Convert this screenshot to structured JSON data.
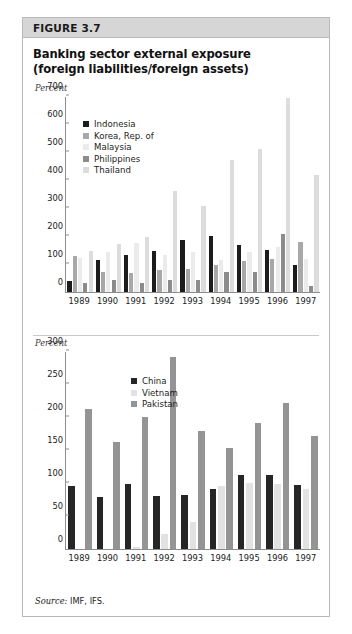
{
  "figure": {
    "label": "FIGURE 3.7",
    "title_line1": "Banking sector external exposure",
    "title_line2": "(foreign liabilities/foreign assets)",
    "source_prefix": "Source:",
    "source_text": "IMF, IFS."
  },
  "colors": {
    "header_band": "#d6d6d6",
    "frame_border": "#b9b9b9",
    "axis": "#8d8d8d",
    "indonesia": "#1c1c1c",
    "korea": "#a8a8a8",
    "malaysia": "#ebebeb",
    "philippines": "#8c8c8c",
    "thailand": "#dcdcdc",
    "china": "#262626",
    "vietnam": "#e2e2e2",
    "pakistan": "#949494"
  },
  "chart_data": [
    {
      "type": "bar",
      "id": "asia-crisis-economies",
      "title": "Banking sector external exposure (foreign liabilities/foreign assets)",
      "xlabel": "",
      "ylabel": "Percent",
      "ylim": [
        0,
        700
      ],
      "yticks": [
        0,
        100,
        200,
        300,
        400,
        500,
        600,
        700
      ],
      "grid": false,
      "legend_position": "upper-left",
      "categories": [
        "1989",
        "1990",
        "1991",
        "1992",
        "1993",
        "1994",
        "1995",
        "1996",
        "1997"
      ],
      "series": [
        {
          "name": "Indonesia",
          "color": "#1c1c1c",
          "values": [
            38,
            112,
            130,
            145,
            185,
            200,
            165,
            148,
            95
          ]
        },
        {
          "name": "Korea, Rep. of",
          "color": "#a8a8a8",
          "values": [
            128,
            72,
            65,
            78,
            82,
            95,
            108,
            118,
            178
          ]
        },
        {
          "name": "Malaysia",
          "color": "#ebebeb",
          "values": [
            120,
            140,
            175,
            130,
            142,
            112,
            140,
            160,
            118
          ]
        },
        {
          "name": "Philippines",
          "color": "#8c8c8c",
          "values": [
            30,
            42,
            30,
            42,
            40,
            70,
            72,
            205,
            22
          ]
        },
        {
          "name": "Thailand",
          "color": "#dcdcdc",
          "values": [
            145,
            170,
            195,
            360,
            305,
            470,
            510,
            690,
            415
          ]
        }
      ]
    },
    {
      "type": "bar",
      "id": "other-asian-economies",
      "title": "Banking sector external exposure (foreign liabilities/foreign assets)",
      "xlabel": "",
      "ylabel": "Percent",
      "ylim": [
        0,
        300
      ],
      "yticks": [
        0,
        50,
        100,
        150,
        200,
        250,
        300
      ],
      "grid": false,
      "legend_position": "upper-center",
      "categories": [
        "1989",
        "1990",
        "1991",
        "1992",
        "1993",
        "1994",
        "1995",
        "1996",
        "1997"
      ],
      "series": [
        {
          "name": "China",
          "color": "#262626",
          "values": [
            95,
            78,
            98,
            80,
            82,
            90,
            112,
            112,
            96
          ]
        },
        {
          "name": "Vietnam",
          "color": "#e2e2e2",
          "values": [
            0,
            0,
            3,
            22,
            40,
            95,
            100,
            98,
            90
          ]
        },
        {
          "name": "Pakistan",
          "color": "#949494",
          "values": [
            212,
            162,
            200,
            290,
            178,
            153,
            190,
            220,
            170
          ]
        }
      ]
    }
  ]
}
